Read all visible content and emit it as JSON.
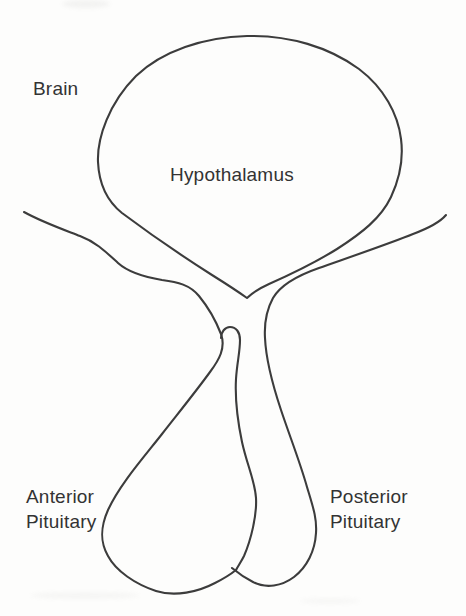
{
  "figure": {
    "labels": {
      "brain": "Brain",
      "hypothalamus": "Hypothalamus",
      "anterior_pituitary": {
        "line1": "Anterior",
        "line2": "Pituitary"
      },
      "posterior_pituitary": {
        "line1": "Posterior",
        "line2": "Pituitary"
      }
    },
    "colors": {
      "line": "#3c3c3c",
      "text": "#333333",
      "background": "#fdfdfc"
    }
  }
}
